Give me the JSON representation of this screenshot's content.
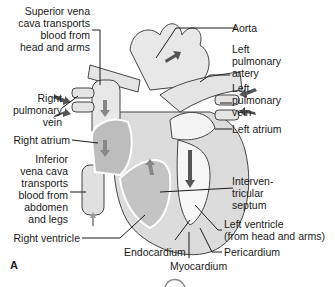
{
  "figure": {
    "panel_label": "A"
  },
  "labels": {
    "superior_vena_cava": [
      "Superior vena",
      "cava transports",
      "blood from",
      "head and arms"
    ],
    "aorta": [
      "Aorta"
    ],
    "left_pulmonary_artery": [
      "Left",
      "pulmonary",
      "artery"
    ],
    "right_pulmonary_vein": [
      "Right",
      "pulmonary",
      "vein"
    ],
    "left_pulmonary_vein": [
      "Left",
      "pulmonary",
      "vein"
    ],
    "right_atrium": [
      "Right atrium"
    ],
    "left_atrium": [
      "Left atrium"
    ],
    "inferior_vena_cava": [
      "Inferior",
      "vena cava",
      "transports",
      "blood from",
      "abdomen",
      "and legs"
    ],
    "interventricular_septum": [
      "Interven-",
      "tricular",
      "septum"
    ],
    "left_ventricle": [
      "Left ventricle",
      "(from head and arms)"
    ],
    "right_ventricle": [
      "Right ventricle"
    ],
    "endocardium": [
      "Endocardium"
    ],
    "pericardium": [
      "Pericardium"
    ],
    "myocardium": [
      "Myocardium"
    ]
  },
  "colors": {
    "heart_wall": "#d9d9d9",
    "chamber": "#bfbfbf",
    "vessel": "#e6e6e6",
    "arrow": "#555555",
    "outline": "#333333",
    "leader_line": "#1a1a1a"
  }
}
